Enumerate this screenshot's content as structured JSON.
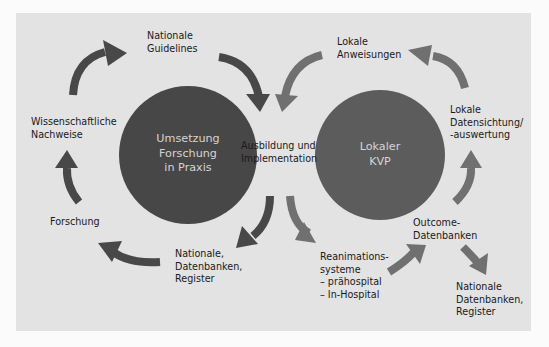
{
  "colors": {
    "background": "#fbfbfb",
    "panel": "#e3e3e3",
    "circle_left": "#474747",
    "circle_right": "#5c5c5c",
    "arrow_dark": "#484848",
    "arrow_light": "#707070",
    "circle_text": "#d4d4d4",
    "label_text": "#1a1a1a"
  },
  "left_cycle": {
    "circle_label": "Umsetzung\nForschung\nin Praxis",
    "nodes": {
      "nationale_guidelines": "Nationale\nGuidelines",
      "wissenschaftliche_nachweise": "Wissenschaftliche\nNachweise",
      "forschung": "Forschung",
      "nationale_datenbanken": "Nationale,\nDatenbanken,\nRegister"
    }
  },
  "center": {
    "label": "Ausbildung und\nImplementation"
  },
  "right_cycle": {
    "circle_label": "Lokaler\nKVP",
    "nodes": {
      "lokale_anweisungen": "Lokale\nAnweisungen",
      "lokale_datensichtung": "Lokale\nDatensichtung/\n-auswertung",
      "outcome_datenbanken": "Outcome-\nDatenbanken",
      "reanimationssysteme": "Reanimations-\nsysteme\n– prähospital\n– In-Hospital",
      "nationale_datenbanken_register": "Nationale\nDatenbanken,\nRegister"
    }
  }
}
